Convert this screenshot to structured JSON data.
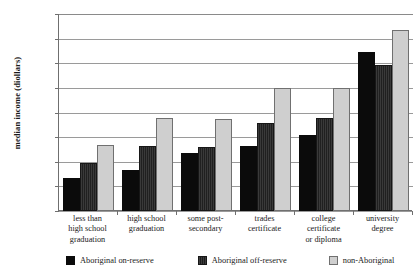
{
  "chart_data": {
    "type": "bar",
    "title": "",
    "xlabel": "",
    "ylabel": "median income (diollars)",
    "ylim": [
      0,
      40000
    ],
    "ytick_labels": [
      "40,000",
      "35,000",
      "30,000",
      "25,000",
      "20,000",
      "15,000",
      "10,000",
      "5,000",
      "0"
    ],
    "ytick_values": [
      40000,
      35000,
      30000,
      25000,
      20000,
      15000,
      10000,
      5000,
      0
    ],
    "grid": true,
    "legend_position": "bottom",
    "categories": [
      "less than high school graduation",
      "high school graduation",
      "some post-secondary",
      "trades certificate",
      "college certificate or diploma",
      "university degree"
    ],
    "category_lines": [
      [
        "less than",
        "high school",
        "graduation"
      ],
      [
        "high school",
        "graduation"
      ],
      [
        "some post-",
        "secondary"
      ],
      [
        "trades",
        "certificate"
      ],
      [
        "college",
        "certificate",
        "or diploma"
      ],
      [
        "university",
        "degree"
      ]
    ],
    "series": [
      {
        "name": "Aboriginal on-reserve",
        "color": "#0b0b0b",
        "values": [
          6700,
          8400,
          11800,
          13300,
          15400,
          32200
        ]
      },
      {
        "name": "Aboriginal off-reserve",
        "color": "#2e2e2e",
        "values": [
          9700,
          13200,
          13000,
          17900,
          18900,
          29600
        ]
      },
      {
        "name": "non-Aboriginal",
        "color": "#cfcfcf",
        "values": [
          13500,
          18900,
          18700,
          24900,
          25000,
          36800
        ]
      }
    ]
  }
}
